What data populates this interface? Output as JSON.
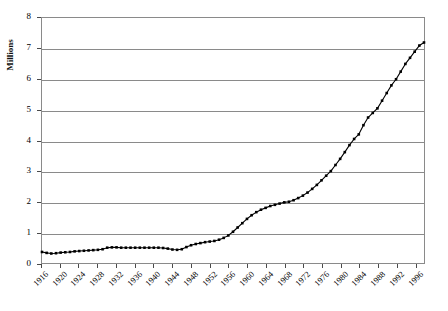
{
  "chart_data": {
    "type": "line",
    "title": "",
    "subtitle": "",
    "xlabel": "",
    "ylabel": "Millions",
    "xlim": [
      1916,
      1998
    ],
    "ylim": [
      0,
      8
    ],
    "grid": true,
    "grid_axis": "y",
    "legend": false,
    "legend_position": "none",
    "marker": "square",
    "line_color": "#000000",
    "marker_color": "#000000",
    "grid_color": "#8a8a8a",
    "y_ticks": [
      0,
      1,
      2,
      3,
      4,
      5,
      6,
      7,
      8
    ],
    "y_tick_labels": [
      "0",
      "1",
      "2",
      "3",
      "4",
      "5",
      "6",
      "7",
      "8"
    ],
    "x_ticks": [
      1916,
      1920,
      1924,
      1928,
      1932,
      1936,
      1940,
      1944,
      1948,
      1952,
      1956,
      1960,
      1964,
      1968,
      1972,
      1976,
      1980,
      1984,
      1988,
      1992,
      1996
    ],
    "x_tick_labels": [
      "1916",
      "1920",
      "1924",
      "1928",
      "1932",
      "1936",
      "1940",
      "1944",
      "1948",
      "1952",
      "1956",
      "1960",
      "1964",
      "1968",
      "1972",
      "1976",
      "1980",
      "1984",
      "1988",
      "1992",
      "1996"
    ],
    "x_tick_rotation": 45,
    "series": [
      {
        "name": "",
        "x": [
          1916,
          1917,
          1918,
          1919,
          1920,
          1921,
          1922,
          1923,
          1924,
          1925,
          1926,
          1927,
          1928,
          1929,
          1930,
          1931,
          1932,
          1933,
          1934,
          1935,
          1936,
          1937,
          1938,
          1939,
          1940,
          1941,
          1942,
          1943,
          1944,
          1945,
          1946,
          1947,
          1948,
          1949,
          1950,
          1951,
          1952,
          1953,
          1954,
          1955,
          1956,
          1957,
          1958,
          1959,
          1960,
          1961,
          1962,
          1963,
          1964,
          1965,
          1966,
          1967,
          1968,
          1969,
          1970,
          1971,
          1972,
          1973,
          1974,
          1975,
          1976,
          1977,
          1978,
          1979,
          1980,
          1981,
          1982,
          1983,
          1984,
          1985,
          1986,
          1987,
          1988,
          1989,
          1990,
          1991,
          1992,
          1993,
          1994,
          1995,
          1996,
          1997,
          1998
        ],
        "values": [
          0.36,
          0.33,
          0.31,
          0.32,
          0.34,
          0.35,
          0.36,
          0.38,
          0.39,
          0.4,
          0.41,
          0.42,
          0.43,
          0.45,
          0.5,
          0.51,
          0.51,
          0.5,
          0.5,
          0.5,
          0.5,
          0.5,
          0.5,
          0.5,
          0.5,
          0.5,
          0.49,
          0.47,
          0.44,
          0.43,
          0.45,
          0.52,
          0.58,
          0.62,
          0.65,
          0.68,
          0.7,
          0.72,
          0.76,
          0.82,
          0.9,
          1.02,
          1.16,
          1.3,
          1.44,
          1.56,
          1.66,
          1.74,
          1.8,
          1.86,
          1.9,
          1.94,
          1.98,
          2.0,
          2.05,
          2.12,
          2.2,
          2.3,
          2.42,
          2.55,
          2.7,
          2.85,
          3.0,
          3.2,
          3.4,
          3.62,
          3.85,
          4.05,
          4.2,
          4.5,
          4.75,
          4.9,
          5.05,
          5.3,
          5.55,
          5.8,
          6.0,
          6.25,
          6.5,
          6.7,
          6.9,
          7.1,
          7.2
        ]
      }
    ]
  }
}
